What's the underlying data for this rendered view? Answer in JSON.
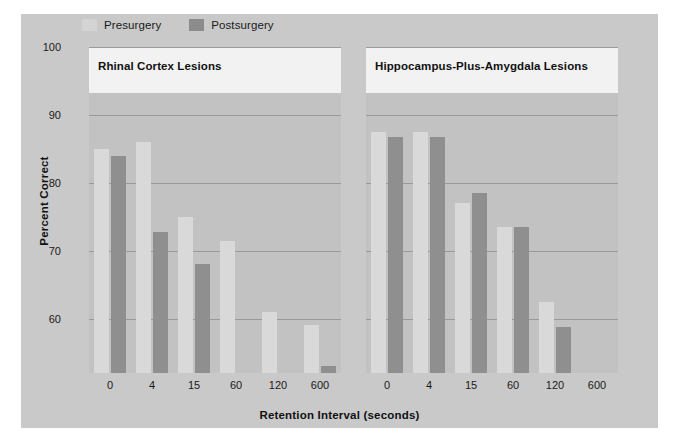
{
  "chart_data": {
    "type": "bar",
    "title": "",
    "xlabel": "Retention Interval (seconds)",
    "ylabel": "Percent Correct",
    "ylim": [
      52,
      100
    ],
    "yticks": [
      60,
      70,
      80,
      90,
      100
    ],
    "ytick_labels": [
      "60",
      "70",
      "80",
      "90",
      "100"
    ],
    "grid": true,
    "legend_position": "top-left",
    "categories": [
      "0",
      "4",
      "15",
      "60",
      "120",
      "600"
    ],
    "panels": [
      {
        "title": "Rhinal Cortex Lesions",
        "series": [
          {
            "name": "Presurgery",
            "values": [
              85.0,
              86.0,
              75.0,
              71.5,
              61.0,
              59.0
            ]
          },
          {
            "name": "Postsurgery",
            "values": [
              84.0,
              72.8,
              68.0,
              null,
              null,
              53.0
            ]
          }
        ]
      },
      {
        "title": "Hippocampus-Plus-Amygdala Lesions",
        "series": [
          {
            "name": "Presurgery",
            "values": [
              87.5,
              87.5,
              77.0,
              73.5,
              62.5,
              null
            ]
          },
          {
            "name": "Postsurgery",
            "values": [
              86.8,
              86.8,
              78.5,
              73.5,
              58.8,
              null
            ]
          }
        ]
      }
    ],
    "legend": [
      {
        "label": "Presurgery",
        "color": "#d9d9d9"
      },
      {
        "label": "Postsurgery",
        "color": "#8f8f8f"
      }
    ]
  },
  "colors": {
    "presurgery": "#d9d9d9",
    "postsurgery": "#8f8f8f",
    "panel_background": "#c2c2c2",
    "figure_background": "#c9c9c9",
    "gridline": "#9a9a9a",
    "title_band": "#f2f2f2",
    "text": "#111111"
  }
}
